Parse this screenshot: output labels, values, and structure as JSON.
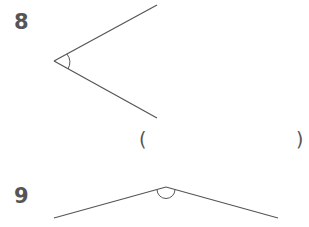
{
  "problems": [
    {
      "number": "8",
      "vertex": [
        54,
        61
      ],
      "ray1_end": [
        157,
        5
      ],
      "ray2_end": [
        157,
        118
      ],
      "arc_type": "acute-angle-arc",
      "answer_blank": {
        "open": "(",
        "close": ")"
      }
    },
    {
      "number": "9",
      "vertex": [
        166,
        187
      ],
      "ray1_end": [
        54,
        218
      ],
      "ray2_end": [
        278,
        218
      ],
      "arc_type": "obtuse-angle-arc"
    }
  ],
  "colors": {
    "line": "#555555",
    "text": "#555555"
  }
}
